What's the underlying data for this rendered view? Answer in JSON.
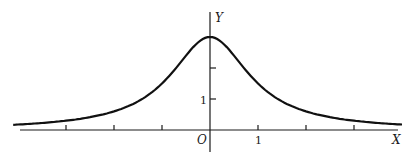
{
  "figure": {
    "y_axis_label": "Y",
    "x_axis_label": "X",
    "origin_label": "O",
    "x_tick_label": "1",
    "y_tick_label": "1"
  },
  "chart_data": {
    "type": "line",
    "title": "",
    "xlabel": "X",
    "ylabel": "Y",
    "function": "y = 3/(1+x^2)",
    "x": [
      -4,
      -3,
      -2,
      -1,
      0,
      1,
      2,
      3,
      4
    ],
    "values": [
      0.18,
      0.3,
      0.6,
      1.5,
      3.0,
      1.5,
      0.6,
      0.3,
      0.18
    ],
    "x_ticks": [
      -3,
      -2,
      -1,
      1,
      2,
      3
    ],
    "y_ticks": [
      1,
      2
    ],
    "labeled_ticks": {
      "x": [
        "1"
      ],
      "y": [
        "1"
      ]
    },
    "xlim": [
      -4.1,
      4.0
    ],
    "ylim": [
      0,
      3.2
    ],
    "grid": false,
    "legend": null
  }
}
